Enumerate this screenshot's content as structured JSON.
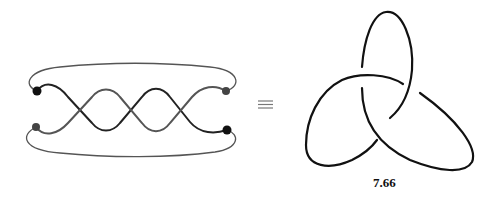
{
  "diagram": {
    "left": {
      "name": "closed-braid",
      "description": "two-strand braid with 3 crossings, closed by outer arcs",
      "crossings": 3,
      "endpoints": [
        {
          "position": "top-left",
          "color": "#111111"
        },
        {
          "position": "bottom-left",
          "color": "#444444"
        },
        {
          "position": "top-right",
          "color": "#444444"
        },
        {
          "position": "bottom-right",
          "color": "#111111"
        }
      ]
    },
    "equivalence_symbol": "≡",
    "right": {
      "name": "trefoil-knot",
      "label": "7.66"
    }
  }
}
